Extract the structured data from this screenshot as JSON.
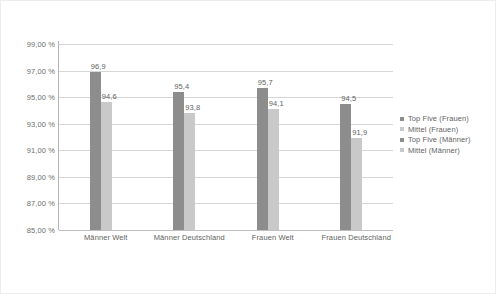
{
  "chart_data": {
    "type": "bar",
    "title": "",
    "subtitle": "",
    "xlabel": "",
    "ylabel": "",
    "ylim": [
      85.0,
      99.0
    ],
    "grid": true,
    "legend_position": "right",
    "categories": [
      "Männer Welt",
      "Männer Deutschland",
      "Frauen Welt",
      "Frauen Deutschland"
    ],
    "ytick_labels": [
      "99,00 %",
      "97,00 %",
      "95,00 %",
      "93,00 %",
      "91,00 %",
      "89,00 %",
      "87,00 %",
      "85,00 %"
    ],
    "ytick_values": [
      99.0,
      97.0,
      95.0,
      93.0,
      91.0,
      89.0,
      87.0,
      85.0
    ],
    "series": [
      {
        "name": "Top Five (Frauen)",
        "color": "#8d8d8d",
        "values": [
          96.9,
          95.4,
          95.7,
          94.5
        ],
        "labels": [
          "96,9",
          "95,4",
          "95,7",
          "94,5"
        ]
      },
      {
        "name": "Mittel (Frauen)",
        "color": "#c9c9c9",
        "values": [
          94.6,
          93.8,
          94.1,
          91.9
        ],
        "labels": [
          "94,6",
          "93,8",
          "94,1",
          "91,9"
        ]
      }
    ],
    "legend_entries": [
      {
        "label": "Top Five (Frauen)",
        "color": "#8d8d8d"
      },
      {
        "label": "Mittel (Frauen)",
        "color": "#c9c9c9"
      },
      {
        "label": "Top Five (Männer)",
        "color": "#8d8d8d"
      },
      {
        "label": "Mittel (Männer)",
        "color": "#c9c9c9"
      }
    ]
  },
  "colors": {
    "dark_bar": "#8d8d8d",
    "light_bar": "#c9c9c9",
    "gridline": "#d6d6d6",
    "axis": "#b4b4b4",
    "text": "#5f5f5f",
    "border": "#ededed",
    "background": "#ffffff"
  }
}
